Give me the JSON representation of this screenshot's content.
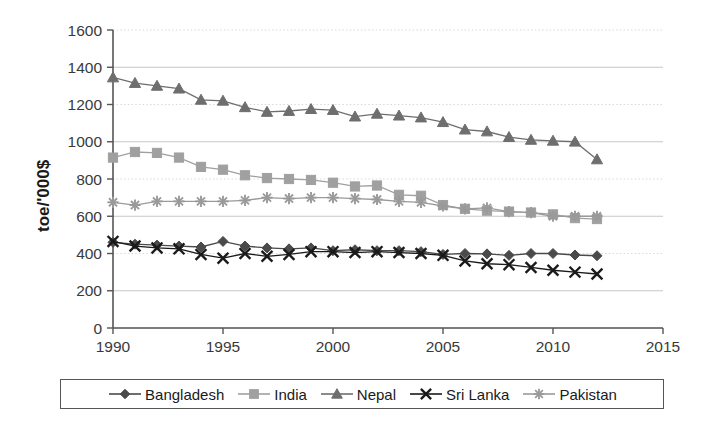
{
  "chart_data": {
    "type": "line",
    "title": "",
    "xlabel": "",
    "ylabel": "toe/'000$",
    "xlim": [
      1990,
      2015
    ],
    "ylim": [
      0,
      1600
    ],
    "xticks": [
      1990,
      1995,
      2000,
      2005,
      2010,
      2015
    ],
    "yticks": [
      0,
      200,
      400,
      600,
      800,
      1000,
      1200,
      1400,
      1600
    ],
    "grid": true,
    "legend_position": "bottom",
    "x": [
      1990,
      1991,
      1992,
      1993,
      1994,
      1995,
      1996,
      1997,
      1998,
      1999,
      2000,
      2001,
      2002,
      2003,
      2004,
      2005,
      2006,
      2007,
      2008,
      2009,
      2010,
      2011,
      2012
    ],
    "series": [
      {
        "name": "Bangladesh",
        "marker": "diamond",
        "color": "#4a4a4a",
        "values": [
          460,
          450,
          445,
          440,
          435,
          465,
          440,
          430,
          425,
          430,
          415,
          420,
          415,
          415,
          410,
          395,
          400,
          398,
          390,
          400,
          400,
          392,
          388
        ]
      },
      {
        "name": "India",
        "marker": "square",
        "color": "#a0a0a0",
        "values": [
          915,
          945,
          940,
          915,
          865,
          850,
          820,
          805,
          800,
          795,
          780,
          760,
          765,
          715,
          710,
          660,
          640,
          630,
          625,
          620,
          610,
          590,
          585
        ]
      },
      {
        "name": "Nepal",
        "marker": "triangle",
        "color": "#6e6e6e",
        "values": [
          1345,
          1315,
          1300,
          1285,
          1225,
          1220,
          1185,
          1160,
          1165,
          1175,
          1170,
          1135,
          1150,
          1140,
          1130,
          1105,
          1065,
          1055,
          1025,
          1010,
          1005,
          1000,
          905
        ]
      },
      {
        "name": "Sri Lanka",
        "marker": "x",
        "color": "#1a1a1a",
        "values": [
          465,
          440,
          430,
          425,
          395,
          375,
          400,
          385,
          395,
          410,
          410,
          405,
          410,
          405,
          400,
          390,
          360,
          345,
          340,
          325,
          310,
          300,
          290
        ]
      },
      {
        "name": "Pakistan",
        "marker": "star",
        "color": "#9a9a9a",
        "values": [
          675,
          660,
          680,
          680,
          680,
          680,
          685,
          700,
          695,
          700,
          700,
          695,
          690,
          680,
          675,
          655,
          640,
          645,
          625,
          620,
          600,
          600,
          600
        ]
      }
    ]
  },
  "axis": {
    "y_label": "toe/'000$",
    "y_tick_labels": [
      "1600",
      "1400",
      "1200",
      "1000",
      "800",
      "600",
      "400",
      "200",
      "0"
    ],
    "x_tick_labels": [
      "1990",
      "1995",
      "2000",
      "2005",
      "2010",
      "2015"
    ]
  },
  "legend": {
    "items": [
      {
        "label": "Bangladesh",
        "marker": "diamond",
        "color": "#4a4a4a"
      },
      {
        "label": "India",
        "marker": "square",
        "color": "#a0a0a0"
      },
      {
        "label": "Nepal",
        "marker": "triangle",
        "color": "#6e6e6e"
      },
      {
        "label": "Sri Lanka",
        "marker": "x",
        "color": "#1a1a1a"
      },
      {
        "label": "Pakistan",
        "marker": "star",
        "color": "#9a9a9a"
      }
    ]
  }
}
